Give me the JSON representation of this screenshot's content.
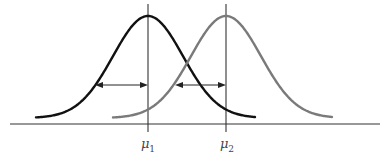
{
  "figure": {
    "axis": {
      "x1": 10,
      "x2": 380,
      "y": 124,
      "color": "#333333"
    },
    "baseline_y": 118,
    "peak_y": 16,
    "sigma_px": 35,
    "curves": [
      {
        "name": "distribution-1",
        "mean_label": "μ",
        "mean_sub": "1",
        "mean_x": 148,
        "x_start": 36,
        "x_end": 255,
        "color": "#111111"
      },
      {
        "name": "distribution-2",
        "mean_label": "μ",
        "mean_sub": "2",
        "mean_x": 226,
        "x_start": 113,
        "x_end": 332,
        "color": "#7a7a7a"
      }
    ],
    "mean_lines": {
      "y_top": 4,
      "y_bottom": 132,
      "color": "#333333"
    },
    "arrows": [
      {
        "x1": 95,
        "x2": 148,
        "y": 85
      },
      {
        "x1": 175,
        "x2": 226,
        "y": 85
      }
    ],
    "labels": [
      {
        "text": "μ",
        "sub": "1",
        "x": 148,
        "y": 136
      },
      {
        "text": "μ",
        "sub": "2",
        "x": 227,
        "y": 136
      }
    ]
  }
}
